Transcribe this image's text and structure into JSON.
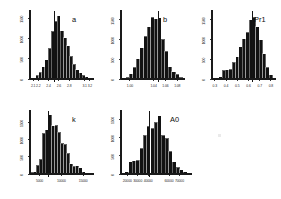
{
  "figure": {
    "background_color": "#ffffff",
    "bar_color": "#121212",
    "axis_color": "#1a1a1a",
    "width": 281,
    "height": 199,
    "panel_count": 5
  },
  "chart_data": [
    {
      "type": "bar",
      "id": "panel-a",
      "title": "a",
      "xlabel": "",
      "ylabel": "",
      "grid": false,
      "legend": null,
      "xtick_labels": [
        "2.1",
        "2.2",
        "2.4",
        "2.6",
        "2.8",
        "3.1",
        "3.2"
      ],
      "xtick_values": [
        2.1,
        2.2,
        2.4,
        2.6,
        2.8,
        3.1,
        3.2
      ],
      "ytick_labels": [
        "0",
        "500",
        "1000",
        "1500"
      ],
      "ytick_values": [
        0,
        500,
        1000,
        1500
      ],
      "ylim": [
        0,
        1650
      ],
      "xlim": [
        2.04,
        3.28
      ],
      "reference_line": 2.52,
      "categories": [
        "2.06",
        "2.12",
        "2.18",
        "2.24",
        "2.30",
        "2.36",
        "2.42",
        "2.48",
        "2.54",
        "2.60",
        "2.66",
        "2.72",
        "2.78",
        "2.84",
        "2.90",
        "2.96",
        "3.02",
        "3.08",
        "3.14",
        "3.20"
      ],
      "values": [
        12,
        30,
        95,
        170,
        300,
        480,
        760,
        1180,
        1420,
        1555,
        1190,
        1020,
        820,
        560,
        360,
        230,
        150,
        95,
        55,
        25
      ]
    },
    {
      "type": "bar",
      "id": "panel-b",
      "title": "b",
      "xlabel": "",
      "ylabel": "",
      "grid": false,
      "legend": null,
      "xtick_labels": [
        "1.00",
        "1.04",
        "1.06",
        "1.08"
      ],
      "xtick_values": [
        1.0,
        1.04,
        1.06,
        1.08
      ],
      "ytick_labels": [
        "0",
        "500",
        "1000",
        "1500"
      ],
      "ytick_values": [
        0,
        500,
        1000,
        1500
      ],
      "ylim": [
        0,
        1700
      ],
      "xlim": [
        0.985,
        1.093
      ],
      "reference_line": 1.049,
      "categories": [
        "0.990",
        "0.996",
        "1.002",
        "1.008",
        "1.014",
        "1.020",
        "1.026",
        "1.032",
        "1.038",
        "1.044",
        "1.050",
        "1.056",
        "1.062",
        "1.068",
        "1.074",
        "1.080",
        "1.086"
      ],
      "values": [
        18,
        40,
        130,
        300,
        520,
        790,
        1080,
        1320,
        1570,
        1530,
        1560,
        1010,
        700,
        310,
        190,
        120,
        45
      ]
    },
    {
      "type": "bar",
      "id": "panel-pr1",
      "title": "Pr1",
      "xlabel": "",
      "ylabel": "",
      "grid": false,
      "legend": null,
      "xtick_labels": [
        "0.3",
        "0.4",
        "0.5",
        "0.6",
        "0.7",
        "0.8"
      ],
      "xtick_values": [
        0.3,
        0.4,
        0.5,
        0.6,
        0.7,
        0.8
      ],
      "ytick_labels": [
        "0",
        "500",
        "1000",
        "1500"
      ],
      "ytick_values": [
        0,
        500,
        1000,
        1500
      ],
      "ylim": [
        0,
        1700
      ],
      "xlim": [
        0.275,
        0.845
      ],
      "reference_line": 0.633,
      "categories": [
        "0.29",
        "0.32",
        "0.35",
        "0.38",
        "0.41",
        "0.44",
        "0.47",
        "0.50",
        "0.53",
        "0.56",
        "0.59",
        "0.62",
        "0.65",
        "0.68",
        "0.71",
        "0.74",
        "0.77",
        "0.80"
      ],
      "values": [
        10,
        25,
        55,
        220,
        230,
        250,
        430,
        560,
        820,
        1020,
        1180,
        1500,
        1570,
        1320,
        1000,
        640,
        300,
        110
      ]
    },
    {
      "type": "bar",
      "id": "panel-k",
      "title": "k",
      "xlabel": "",
      "ylabel": "",
      "grid": false,
      "legend": null,
      "xtick_labels": [
        "5000",
        "10000",
        "15000"
      ],
      "xtick_values": [
        5000,
        10000,
        15000
      ],
      "ytick_labels": [
        "0",
        "500",
        "1000",
        "1500"
      ],
      "ytick_values": [
        0,
        500,
        1000,
        1500
      ],
      "ylim": [
        0,
        1800
      ],
      "xlim": [
        2800,
        17500
      ],
      "reference_line": 7150,
      "categories": [
        "3200",
        "3900",
        "4600",
        "5300",
        "6000",
        "6700",
        "7400",
        "8100",
        "8800",
        "9500",
        "10200",
        "10900",
        "11600",
        "12300",
        "13000",
        "13700",
        "14400",
        "15100",
        "15800",
        "16500"
      ],
      "values": [
        45,
        70,
        260,
        430,
        1180,
        1280,
        1720,
        1400,
        1420,
        1210,
        900,
        870,
        600,
        300,
        230,
        245,
        180,
        70,
        30,
        12
      ]
    },
    {
      "type": "bar",
      "id": "panel-a0",
      "title": "A0",
      "xlabel": "",
      "ylabel": "",
      "grid": false,
      "legend": null,
      "xtick_labels": [
        "20000",
        "30000",
        "40000",
        "60000",
        "70000"
      ],
      "xtick_values": [
        20000,
        30000,
        40000,
        60000,
        70000
      ],
      "ytick_labels": [
        "0",
        "500",
        "1000",
        "1500"
      ],
      "ytick_values": [
        0,
        500,
        1000,
        1500
      ],
      "ylim": [
        0,
        1700
      ],
      "xlim": [
        14000,
        82000
      ],
      "reference_line": 41500,
      "categories": [
        "16000",
        "19500",
        "23000",
        "26500",
        "30000",
        "33500",
        "37000",
        "40500",
        "44000",
        "47500",
        "51000",
        "54500",
        "58000",
        "61500",
        "65000",
        "68500",
        "72000",
        "75500",
        "79000"
      ],
      "values": [
        25,
        60,
        330,
        370,
        380,
        700,
        1060,
        1310,
        1250,
        1420,
        1600,
        1060,
        980,
        620,
        330,
        180,
        120,
        60,
        25
      ]
    }
  ]
}
